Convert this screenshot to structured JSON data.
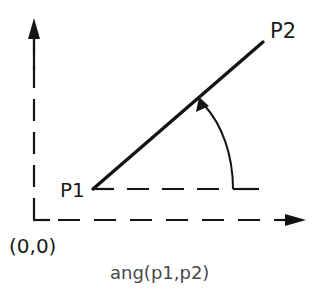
{
  "diagram": {
    "labels": {
      "p1": "P1",
      "p2": "P2",
      "origin": "(0,0)",
      "caption": "ang(p1,p2)"
    },
    "points": {
      "origin": {
        "x": 34,
        "y": 220
      },
      "p1": {
        "x": 93,
        "y": 189
      },
      "p2": {
        "x": 263,
        "y": 42
      }
    },
    "colors": {
      "stroke": "#141414",
      "text": "#1a1a1a",
      "caption": "#4a4a4a",
      "background": "#ffffff"
    }
  }
}
